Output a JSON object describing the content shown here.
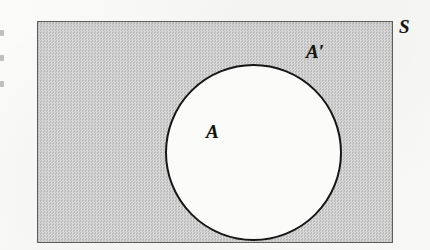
{
  "figure": {
    "kind": "venn-diagram",
    "background_color": "#f7f7f5",
    "universe": {
      "label": "S",
      "name": "universal-set",
      "shape": "rectangle",
      "fill_color": "#c9c9c9",
      "border_color": "#5d5d5d",
      "fill_style": "dithered-halftone-gray"
    },
    "subset": {
      "label": "A",
      "name": "set-a",
      "shape": "circle",
      "fill_color": "#fbfbfa",
      "border_color": "#161616"
    },
    "complement": {
      "label": "A′",
      "name": "complement-of-a",
      "region": "shaded"
    },
    "margin_marks": {
      "count": 3,
      "description": "faint truncated glyph fragments at the left page margin"
    }
  }
}
